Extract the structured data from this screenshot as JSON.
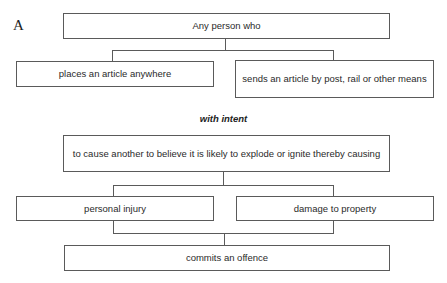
{
  "figure_label": "A",
  "nodes": {
    "subject": "Any person who",
    "act_place": "places an article anywhere",
    "act_send": "sends an article by post, rail or other means",
    "intent_heading": "with intent",
    "intent": "to cause another to believe it is likely to explode or ignite thereby causing",
    "result_injury": "personal injury",
    "result_damage": "damage to property",
    "conclusion": "commits an offence"
  }
}
